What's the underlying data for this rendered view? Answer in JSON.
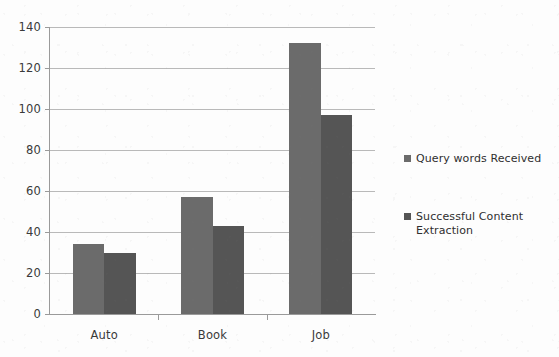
{
  "chart_data": {
    "type": "bar",
    "title": "",
    "subtitle": "",
    "xlabel": "",
    "ylabel": "",
    "categories": [
      "Auto",
      "Book",
      "Job"
    ],
    "series": [
      {
        "name": "Query words Received",
        "color": "#6b6b6b",
        "values": [
          34,
          57,
          132
        ]
      },
      {
        "name": "Successful Content\nExtraction",
        "color": "#555555",
        "values": [
          30,
          43,
          97
        ]
      }
    ],
    "ylim": [
      0,
      140
    ],
    "yticks": [
      0,
      20,
      40,
      60,
      80,
      100,
      120,
      140
    ],
    "ytick_labels": [
      "0",
      "20",
      "40",
      "60",
      "80",
      "100",
      "120",
      "140"
    ],
    "grid": "horizontal",
    "legend_position": "right",
    "plot_background": "#fdfdfd",
    "gridline_color": "#b9b9b9",
    "axis_color": "#9a9a9a"
  }
}
